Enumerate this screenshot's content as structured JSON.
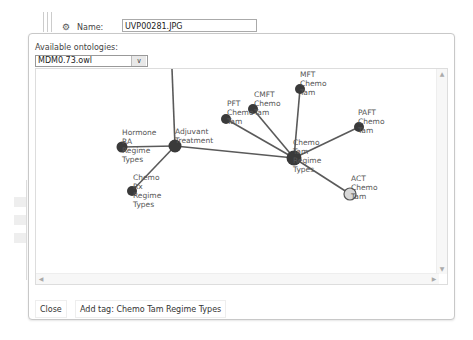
{
  "background": {
    "name_label": "Name:",
    "name_value": "UVP00281.JPG"
  },
  "dialog": {
    "ontologies_label": "Available ontologies:",
    "ontology_selected": "MDM0.73.owl",
    "buttons": {
      "close": "Close",
      "add_tag": "Add tag: Chemo Tam Regime Types"
    }
  },
  "graph": {
    "nodes": [
      {
        "id": "adjuvant",
        "label": [
          "Adjuvant",
          "Treatment"
        ]
      },
      {
        "id": "hormone",
        "label": [
          "Hormone",
          "RA",
          "Regime",
          "Types"
        ]
      },
      {
        "id": "chemo_rx",
        "label": [
          "Chemo",
          "Rx",
          "Regime",
          "Types"
        ]
      },
      {
        "id": "chemo_tam",
        "label": [
          "Chemo",
          "Tam",
          "Regime",
          "Types"
        ]
      },
      {
        "id": "pft",
        "label": [
          "PFT",
          "Chemo",
          "Tam"
        ]
      },
      {
        "id": "cmft",
        "label": [
          "CMFT",
          "Chemo",
          "Tam"
        ]
      },
      {
        "id": "mft",
        "label": [
          "MFT",
          "Chemo",
          "Tam"
        ]
      },
      {
        "id": "paft",
        "label": [
          "PAFT",
          "Chemo",
          "Tam"
        ]
      },
      {
        "id": "act",
        "label": [
          "ACT",
          "Chemo",
          "Tam"
        ],
        "selected": true
      }
    ],
    "colors": {
      "node": "#3a3a3a",
      "edge": "#5a5a5a",
      "selected_node_fill": "#d8d8d8"
    }
  }
}
